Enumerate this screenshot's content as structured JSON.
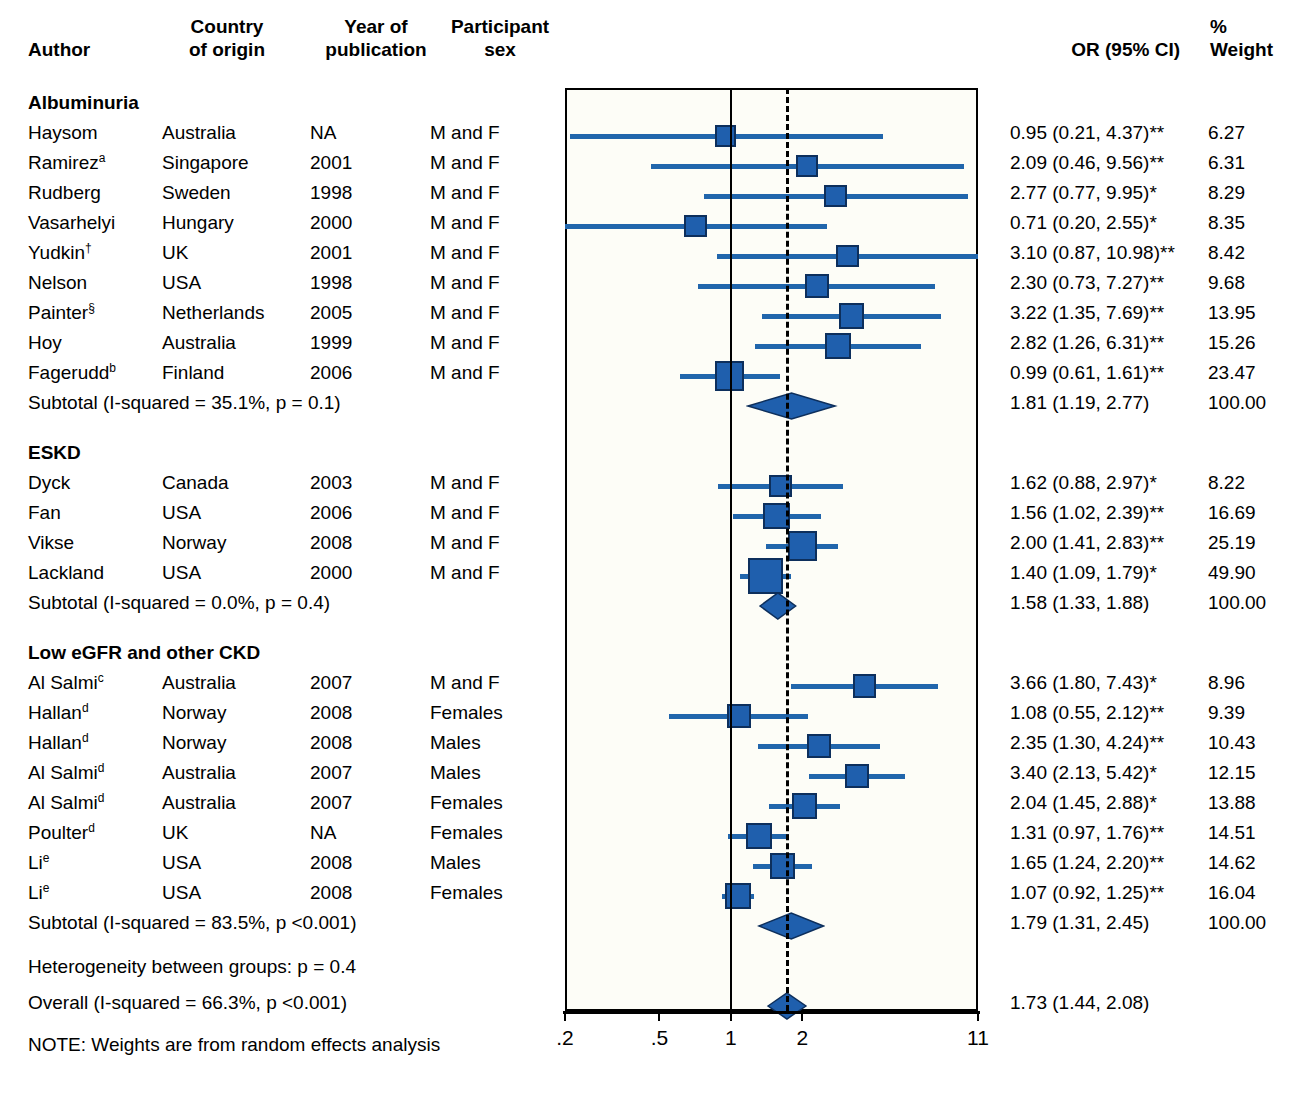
{
  "header": {
    "author": "Author",
    "country": "Country\nof origin",
    "year": "Year of\npublication",
    "sex": "Participant\nsex",
    "or": "OR (95% CI)",
    "weight": "%\nWeight"
  },
  "axis": {
    "ticks": [
      ".2",
      ".5",
      "1",
      "2",
      "11"
    ],
    "tick_values": [
      0.2,
      0.5,
      1,
      2,
      11
    ],
    "scale": "log",
    "null_value": 1,
    "pooled_value": 1.73
  },
  "footnotes": {
    "heterogeneity": "Heterogeneity between groups: p = 0.4",
    "overall_label": "Overall (I-squared = 66.3%, p <0.001)",
    "overall_or": "1.73 (1.44, 2.08)",
    "note": "NOTE: Weights are from random effects analysis"
  },
  "colors": {
    "marker": "#1F5FAD",
    "marker_border": "#0d2f5c",
    "ci_line": "#2166AC",
    "plot_bg": "#fdfdf7",
    "axis": "#000000"
  },
  "groups": [
    {
      "title": "Albuminuria",
      "rows": [
        {
          "author": "Haysom",
          "sup": "",
          "country": "Australia",
          "year": "NA",
          "sex": "M and F",
          "or_text": "0.95 (0.21, 4.37)**",
          "weight": "6.27",
          "est": 0.95,
          "lo": 0.21,
          "hi": 4.37,
          "wt": 6.27
        },
        {
          "author": "Ramirez",
          "sup": "a",
          "country": "Singapore",
          "year": "2001",
          "sex": "M and F",
          "or_text": "2.09 (0.46, 9.56)**",
          "weight": "6.31",
          "est": 2.09,
          "lo": 0.46,
          "hi": 9.56,
          "wt": 6.31
        },
        {
          "author": "Rudberg",
          "sup": "",
          "country": "Sweden",
          "year": "1998",
          "sex": "M and F",
          "or_text": "2.77 (0.77, 9.95)*",
          "weight": "8.29",
          "est": 2.77,
          "lo": 0.77,
          "hi": 9.95,
          "wt": 8.29
        },
        {
          "author": "Vasarhelyi",
          "sup": "",
          "country": "Hungary",
          "year": "2000",
          "sex": "M and F",
          "or_text": "0.71 (0.20, 2.55)*",
          "weight": "8.35",
          "est": 0.71,
          "lo": 0.2,
          "hi": 2.55,
          "wt": 8.35
        },
        {
          "author": "Yudkin",
          "sup": "†",
          "country": "UK",
          "year": "2001",
          "sex": "M and F",
          "or_text": "3.10 (0.87, 10.98)**",
          "weight": "8.42",
          "est": 3.1,
          "lo": 0.87,
          "hi": 10.98,
          "wt": 8.42
        },
        {
          "author": "Nelson",
          "sup": "",
          "country": "USA",
          "year": "1998",
          "sex": "M and F",
          "or_text": "2.30 (0.73, 7.27)**",
          "weight": "9.68",
          "est": 2.3,
          "lo": 0.73,
          "hi": 7.27,
          "wt": 9.68
        },
        {
          "author": "Painter",
          "sup": "§",
          "country": "Netherlands",
          "year": "2005",
          "sex": "M and F",
          "or_text": "3.22 (1.35, 7.69)**",
          "weight": "13.95",
          "est": 3.22,
          "lo": 1.35,
          "hi": 7.69,
          "wt": 13.95
        },
        {
          "author": "Hoy",
          "sup": "",
          "country": "Australia",
          "year": "1999",
          "sex": "M and F",
          "or_text": "2.82 (1.26, 6.31)**",
          "weight": "15.26",
          "est": 2.82,
          "lo": 1.26,
          "hi": 6.31,
          "wt": 15.26
        },
        {
          "author": "Fagerudd",
          "sup": "b",
          "country": "Finland",
          "year": "2006",
          "sex": "M and F",
          "or_text": "0.99 (0.61, 1.61)**",
          "weight": "23.47",
          "est": 0.99,
          "lo": 0.61,
          "hi": 1.61,
          "wt": 23.47
        }
      ],
      "subtotal": {
        "label": "Subtotal (I-squared = 35.1%, p = 0.1)",
        "or_text": "1.81 (1.19, 2.77)",
        "weight": "100.00",
        "est": 1.81,
        "lo": 1.19,
        "hi": 2.77
      }
    },
    {
      "title": "ESKD",
      "rows": [
        {
          "author": "Dyck",
          "sup": "",
          "country": "Canada",
          "year": "2003",
          "sex": "M and F",
          "or_text": "1.62 (0.88, 2.97)*",
          "weight": "8.22",
          "est": 1.62,
          "lo": 0.88,
          "hi": 2.97,
          "wt": 8.22
        },
        {
          "author": "Fan",
          "sup": "",
          "country": "USA",
          "year": "2006",
          "sex": "M and F",
          "or_text": "1.56 (1.02, 2.39)**",
          "weight": "16.69",
          "est": 1.56,
          "lo": 1.02,
          "hi": 2.39,
          "wt": 16.69
        },
        {
          "author": "Vikse",
          "sup": "",
          "country": "Norway",
          "year": "2008",
          "sex": "M and F",
          "or_text": "2.00 (1.41, 2.83)**",
          "weight": "25.19",
          "est": 2.0,
          "lo": 1.41,
          "hi": 2.83,
          "wt": 25.19
        },
        {
          "author": "Lackland",
          "sup": "",
          "country": "USA",
          "year": "2000",
          "sex": "M and F",
          "or_text": "1.40 (1.09, 1.79)*",
          "weight": "49.90",
          "est": 1.4,
          "lo": 1.09,
          "hi": 1.79,
          "wt": 49.9
        }
      ],
      "subtotal": {
        "label": "Subtotal (I-squared = 0.0%, p = 0.4)",
        "or_text": "1.58 (1.33, 1.88)",
        "weight": "100.00",
        "est": 1.58,
        "lo": 1.33,
        "hi": 1.88
      }
    },
    {
      "title": "Low eGFR and other CKD",
      "rows": [
        {
          "author": "Al Salmi",
          "sup": "c",
          "country": "Australia",
          "year": "2007",
          "sex": "M and F",
          "or_text": "3.66 (1.80, 7.43)*",
          "weight": "8.96",
          "est": 3.66,
          "lo": 1.8,
          "hi": 7.43,
          "wt": 8.96
        },
        {
          "author": "Hallan",
          "sup": "d",
          "country": "Norway",
          "year": "2008",
          "sex": "Females",
          "or_text": "1.08 (0.55, 2.12)**",
          "weight": "9.39",
          "est": 1.08,
          "lo": 0.55,
          "hi": 2.12,
          "wt": 9.39
        },
        {
          "author": "Hallan",
          "sup": "d",
          "country": "Norway",
          "year": "2008",
          "sex": "Males",
          "or_text": "2.35 (1.30, 4.24)**",
          "weight": "10.43",
          "est": 2.35,
          "lo": 1.3,
          "hi": 4.24,
          "wt": 10.43
        },
        {
          "author": "Al Salmi",
          "sup": "d",
          "country": "Australia",
          "year": "2007",
          "sex": "Males",
          "or_text": "3.40 (2.13, 5.42)*",
          "weight": "12.15",
          "est": 3.4,
          "lo": 2.13,
          "hi": 5.42,
          "wt": 12.15
        },
        {
          "author": "Al Salmi",
          "sup": "d",
          "country": "Australia",
          "year": "2007",
          "sex": "Females",
          "or_text": "2.04 (1.45, 2.88)*",
          "weight": "13.88",
          "est": 2.04,
          "lo": 1.45,
          "hi": 2.88,
          "wt": 13.88
        },
        {
          "author": "Poulter",
          "sup": "d",
          "country": "UK",
          "year": "NA",
          "sex": "Females",
          "or_text": "1.31 (0.97, 1.76)**",
          "weight": "14.51",
          "est": 1.31,
          "lo": 0.97,
          "hi": 1.76,
          "wt": 14.51
        },
        {
          "author": "Li",
          "sup": "e",
          "country": "USA",
          "year": "2008",
          "sex": "Males",
          "or_text": "1.65 (1.24, 2.20)**",
          "weight": "14.62",
          "est": 1.65,
          "lo": 1.24,
          "hi": 2.2,
          "wt": 14.62
        },
        {
          "author": "Li",
          "sup": "e",
          "country": "USA",
          "year": "2008",
          "sex": "Females",
          "or_text": "1.07 (0.92, 1.25)**",
          "weight": "16.04",
          "est": 1.07,
          "lo": 0.92,
          "hi": 1.25,
          "wt": 16.04
        }
      ],
      "subtotal": {
        "label": "Subtotal (I-squared = 83.5%, p <0.001)",
        "or_text": "1.79 (1.31, 2.45)",
        "weight": "100.00",
        "est": 1.79,
        "lo": 1.31,
        "hi": 2.45
      }
    }
  ],
  "overall": {
    "est": 1.73,
    "lo": 1.44,
    "hi": 2.08
  },
  "chart_data": {
    "type": "forest",
    "title": "",
    "xlabel": "",
    "ylabel": "",
    "xscale": "log",
    "xlim": [
      0.2,
      11
    ],
    "xticks": [
      0.2,
      0.5,
      1,
      2,
      11
    ],
    "xticklabels": [
      ".2",
      ".5",
      "1",
      "2",
      "11"
    ],
    "reference_line": 1,
    "pooled_line": 1.73,
    "effect_measure": "OR (95% CI)",
    "weights_note": "Weights are from random effects analysis",
    "heterogeneity_between_groups_p": 0.4,
    "overall": {
      "label": "Overall (I-squared = 66.3%, p <0.001)",
      "or": 1.73,
      "ci": [
        1.44,
        2.08
      ]
    },
    "subgroups": [
      {
        "name": "Albuminuria",
        "i_squared": 35.1,
        "p": "0.1",
        "pooled": {
          "or": 1.81,
          "ci": [
            1.19,
            2.77
          ],
          "weight": 100.0
        },
        "studies": [
          {
            "label": "Haysom",
            "or": 0.95,
            "ci": [
              0.21,
              4.37
            ],
            "weight": 6.27
          },
          {
            "label": "Ramirez",
            "or": 2.09,
            "ci": [
              0.46,
              9.56
            ],
            "weight": 6.31
          },
          {
            "label": "Rudberg",
            "or": 2.77,
            "ci": [
              0.77,
              9.95
            ],
            "weight": 8.29
          },
          {
            "label": "Vasarhelyi",
            "or": 0.71,
            "ci": [
              0.2,
              2.55
            ],
            "weight": 8.35
          },
          {
            "label": "Yudkin",
            "or": 3.1,
            "ci": [
              0.87,
              10.98
            ],
            "weight": 8.42
          },
          {
            "label": "Nelson",
            "or": 2.3,
            "ci": [
              0.73,
              7.27
            ],
            "weight": 9.68
          },
          {
            "label": "Painter",
            "or": 3.22,
            "ci": [
              1.35,
              7.69
            ],
            "weight": 13.95
          },
          {
            "label": "Hoy",
            "or": 2.82,
            "ci": [
              1.26,
              6.31
            ],
            "weight": 15.26
          },
          {
            "label": "Fagerudd",
            "or": 0.99,
            "ci": [
              0.61,
              1.61
            ],
            "weight": 23.47
          }
        ]
      },
      {
        "name": "ESKD",
        "i_squared": 0.0,
        "p": "0.4",
        "pooled": {
          "or": 1.58,
          "ci": [
            1.33,
            1.88
          ],
          "weight": 100.0
        },
        "studies": [
          {
            "label": "Dyck",
            "or": 1.62,
            "ci": [
              0.88,
              2.97
            ],
            "weight": 8.22
          },
          {
            "label": "Fan",
            "or": 1.56,
            "ci": [
              1.02,
              2.39
            ],
            "weight": 16.69
          },
          {
            "label": "Vikse",
            "or": 2.0,
            "ci": [
              1.41,
              2.83
            ],
            "weight": 25.19
          },
          {
            "label": "Lackland",
            "or": 1.4,
            "ci": [
              1.09,
              1.79
            ],
            "weight": 49.9
          }
        ]
      },
      {
        "name": "Low eGFR and other CKD",
        "i_squared": 83.5,
        "p": "<0.001",
        "pooled": {
          "or": 1.79,
          "ci": [
            1.31,
            2.45
          ],
          "weight": 100.0
        },
        "studies": [
          {
            "label": "Al Salmi",
            "or": 3.66,
            "ci": [
              1.8,
              7.43
            ],
            "weight": 8.96
          },
          {
            "label": "Hallan (F)",
            "or": 1.08,
            "ci": [
              0.55,
              2.12
            ],
            "weight": 9.39
          },
          {
            "label": "Hallan (M)",
            "or": 2.35,
            "ci": [
              1.3,
              4.24
            ],
            "weight": 10.43
          },
          {
            "label": "Al Salmi (M)",
            "or": 3.4,
            "ci": [
              2.13,
              5.42
            ],
            "weight": 12.15
          },
          {
            "label": "Al Salmi (F)",
            "or": 2.04,
            "ci": [
              1.45,
              2.88
            ],
            "weight": 13.88
          },
          {
            "label": "Poulter (F)",
            "or": 1.31,
            "ci": [
              0.97,
              1.76
            ],
            "weight": 14.51
          },
          {
            "label": "Li (M)",
            "or": 1.65,
            "ci": [
              1.24,
              2.2
            ],
            "weight": 14.62
          },
          {
            "label": "Li (F)",
            "or": 1.07,
            "ci": [
              0.92,
              1.25
            ],
            "weight": 16.04
          }
        ]
      }
    ]
  }
}
